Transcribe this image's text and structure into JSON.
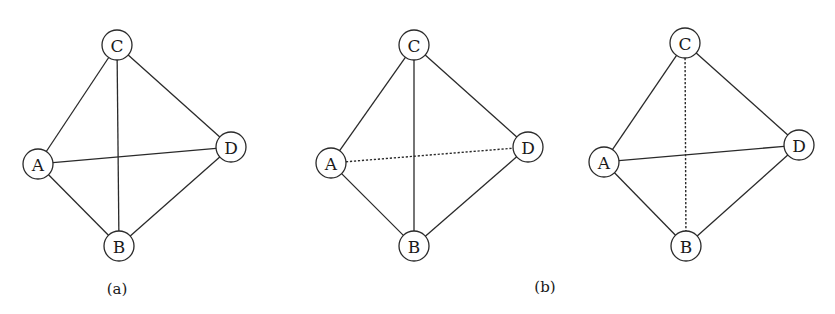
{
  "figure": {
    "node_radius": 15,
    "stroke_color": "#2a2a2a",
    "panels": [
      {
        "id": "a",
        "label": "(a)",
        "label_pos": [
          117,
          289
        ],
        "nodes": [
          {
            "id": "C",
            "label": "C",
            "x": 117,
            "y": 45
          },
          {
            "id": "A",
            "label": "A",
            "x": 38,
            "y": 164
          },
          {
            "id": "D",
            "label": "D",
            "x": 231,
            "y": 147
          },
          {
            "id": "B",
            "label": "B",
            "x": 119,
            "y": 246
          }
        ],
        "edges": [
          {
            "from": "A",
            "to": "C",
            "style": "solid"
          },
          {
            "from": "C",
            "to": "D",
            "style": "solid"
          },
          {
            "from": "D",
            "to": "B",
            "style": "solid"
          },
          {
            "from": "B",
            "to": "A",
            "style": "solid"
          },
          {
            "from": "C",
            "to": "B",
            "style": "solid"
          },
          {
            "from": "A",
            "to": "D",
            "style": "solid"
          }
        ]
      },
      {
        "id": "b1",
        "label": "(b)",
        "label_pos": [
          545,
          287
        ],
        "nodes": [
          {
            "id": "C",
            "label": "C",
            "x": 414,
            "y": 45
          },
          {
            "id": "A",
            "label": "A",
            "x": 331,
            "y": 163
          },
          {
            "id": "D",
            "label": "D",
            "x": 528,
            "y": 147
          },
          {
            "id": "B",
            "label": "B",
            "x": 414,
            "y": 246
          }
        ],
        "edges": [
          {
            "from": "A",
            "to": "C",
            "style": "solid"
          },
          {
            "from": "C",
            "to": "D",
            "style": "solid"
          },
          {
            "from": "D",
            "to": "B",
            "style": "solid"
          },
          {
            "from": "B",
            "to": "A",
            "style": "solid"
          },
          {
            "from": "C",
            "to": "B",
            "style": "solid"
          },
          {
            "from": "A",
            "to": "D",
            "style": "dashed"
          }
        ]
      },
      {
        "id": "b2",
        "label": "",
        "label_pos": null,
        "nodes": [
          {
            "id": "C",
            "label": "C",
            "x": 685,
            "y": 43
          },
          {
            "id": "A",
            "label": "A",
            "x": 604,
            "y": 162
          },
          {
            "id": "D",
            "label": "D",
            "x": 799,
            "y": 145
          },
          {
            "id": "B",
            "label": "B",
            "x": 686,
            "y": 246
          }
        ],
        "edges": [
          {
            "from": "A",
            "to": "C",
            "style": "solid"
          },
          {
            "from": "C",
            "to": "D",
            "style": "solid"
          },
          {
            "from": "D",
            "to": "B",
            "style": "solid"
          },
          {
            "from": "B",
            "to": "A",
            "style": "solid"
          },
          {
            "from": "C",
            "to": "B",
            "style": "dashed"
          },
          {
            "from": "A",
            "to": "D",
            "style": "solid"
          }
        ]
      }
    ]
  }
}
